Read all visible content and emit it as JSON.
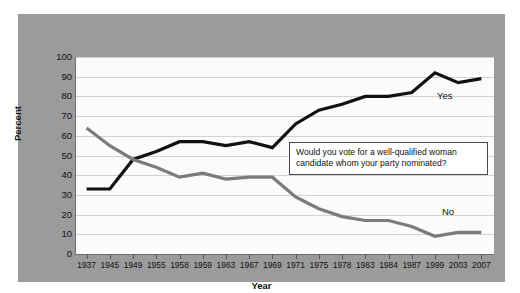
{
  "chart_data": {
    "type": "line",
    "title": "",
    "subtitle": "",
    "xlabel": "Year",
    "ylabel": "Percent",
    "ylim": [
      0,
      100
    ],
    "ytick_step": 10,
    "yticks": [
      0,
      10,
      20,
      30,
      40,
      50,
      60,
      70,
      80,
      90,
      100
    ],
    "grid": "horizontal",
    "legend": "inline-end-of-line",
    "categories": [
      "1937",
      "1945",
      "1949",
      "1955",
      "1958",
      "1959",
      "1963",
      "1967",
      "1969",
      "1971",
      "1975",
      "1978",
      "1983",
      "1984",
      "1987",
      "1999",
      "2003",
      "2007"
    ],
    "series": [
      {
        "name": "Yes",
        "color": "#111111",
        "values": [
          33,
          33,
          48,
          52,
          57,
          57,
          55,
          57,
          54,
          66,
          73,
          76,
          80,
          80,
          82,
          92,
          87,
          89
        ]
      },
      {
        "name": "No",
        "color": "#7b7b7b",
        "values": [
          64,
          55,
          48,
          44,
          39,
          41,
          38,
          39,
          39,
          29,
          23,
          19,
          17,
          17,
          14,
          9,
          11,
          11
        ]
      }
    ],
    "annotations": [
      {
        "name": "survey-question",
        "text": "Would you vote for a well-qualified woman\ncandidate whom your party nominated?"
      }
    ]
  },
  "labels": {
    "series_yes": "Yes",
    "series_no": "No",
    "axis_x": "Year",
    "axis_y": "Percent"
  },
  "colors": {
    "panel_background": "#9b9b9b",
    "plot_background": "#fbfbfb",
    "gridline": "#d2d2d2",
    "axis": "#6f6f6f",
    "series_yes": "#111111",
    "series_no": "#7b7b7b",
    "callout_border": "#4a4a4a",
    "text": "#111111"
  }
}
